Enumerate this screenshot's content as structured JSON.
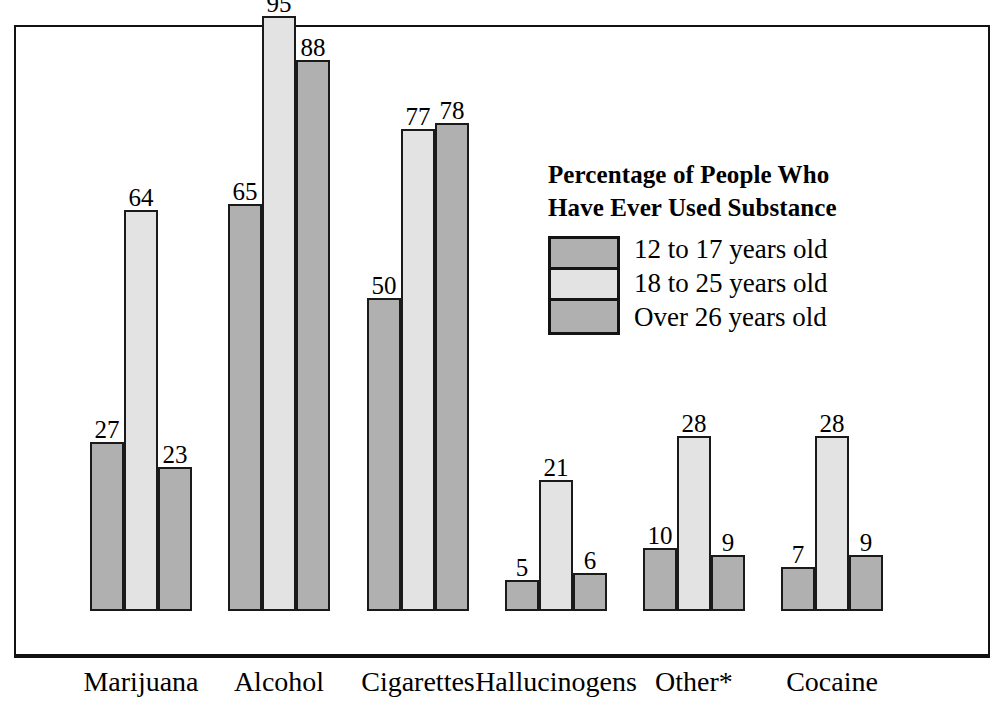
{
  "chart_data": {
    "type": "bar",
    "title": "Percentage of People Who Have Ever Used Substance",
    "title_line1": "Percentage of People Who",
    "title_line2": "Have Ever Used Substance",
    "xlabel": "",
    "ylabel": "",
    "ylim": [
      0,
      100
    ],
    "grid": false,
    "legend_position": "inside-right",
    "categories": [
      "Marijuana",
      "Alcohol",
      "Cigarettes",
      "Hallucinogens",
      "Other*",
      "Cocaine"
    ],
    "series": [
      {
        "name": "12 to 17 years old",
        "color": "#b0b0b0",
        "values": [
          27,
          65,
          50,
          5,
          10,
          7
        ]
      },
      {
        "name": "18 to 25 years old",
        "color": "#e3e3e3",
        "values": [
          64,
          95,
          77,
          21,
          28,
          28
        ]
      },
      {
        "name": "Over 26 years old",
        "color": "#b0b0b0",
        "values": [
          23,
          88,
          78,
          6,
          9,
          9
        ]
      }
    ],
    "data_labels": [
      [
        "27",
        "64",
        "23"
      ],
      [
        "65",
        "95",
        "88"
      ],
      [
        "50",
        "77",
        "78"
      ],
      [
        "5",
        "21",
        "6"
      ],
      [
        "10",
        "28",
        "9"
      ],
      [
        "7",
        "28",
        "9"
      ]
    ],
    "annotations": [
      "Other*"
    ]
  },
  "legend": {
    "title_line1": "Percentage of People Who",
    "title_line2": "Have Ever Used Substance",
    "entries": [
      {
        "label": "12 to 17 years old",
        "color": "#b0b0b0"
      },
      {
        "label": "18 to 25 years old",
        "color": "#e3e3e3"
      },
      {
        "label": "Over 26 years old",
        "color": "#b0b0b0"
      }
    ]
  },
  "axis": {
    "categories": [
      "Marijuana",
      "Alcohol",
      "Cigarettes",
      "Hallucinogens",
      "Other*",
      "Cocaine"
    ]
  },
  "colors": {
    "series_dark": "#b0b0b0",
    "series_light": "#e3e3e3",
    "frame": "#121212",
    "text": "#000000"
  }
}
